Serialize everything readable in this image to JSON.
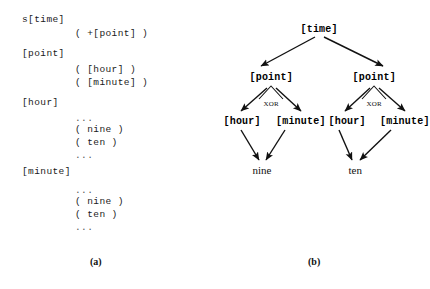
{
  "figure": {
    "panel_a": {
      "caption": "(a)",
      "lines": [
        {
          "kind": "head",
          "text": "s[time]",
          "x": 22,
          "y": 14
        },
        {
          "kind": "rule",
          "text": "( +[point] )",
          "x": 75,
          "y": 28
        },
        {
          "kind": "head",
          "text": "[point]",
          "x": 22,
          "y": 48
        },
        {
          "kind": "rule",
          "text": "( [hour] )",
          "x": 75,
          "y": 64
        },
        {
          "kind": "rule",
          "text": "( [minute] )",
          "x": 75,
          "y": 77
        },
        {
          "kind": "head",
          "text": "[hour]",
          "x": 22,
          "y": 97
        },
        {
          "kind": "ellip",
          "text": "...",
          "x": 75,
          "y": 113
        },
        {
          "kind": "rule",
          "text": "( nine )",
          "x": 75,
          "y": 124
        },
        {
          "kind": "rule",
          "text": "( ten )",
          "x": 75,
          "y": 137
        },
        {
          "kind": "ellip",
          "text": "...",
          "x": 75,
          "y": 150
        },
        {
          "kind": "head",
          "text": "[minute]",
          "x": 22,
          "y": 166
        },
        {
          "kind": "ellip",
          "text": "...",
          "x": 75,
          "y": 185
        },
        {
          "kind": "rule",
          "text": "( nine )",
          "x": 75,
          "y": 196
        },
        {
          "kind": "rule",
          "text": "( ten )",
          "x": 75,
          "y": 209
        },
        {
          "kind": "ellip",
          "text": "...",
          "x": 75,
          "y": 222
        }
      ]
    },
    "panel_b": {
      "caption": "(b)",
      "nodes": [
        {
          "id": "root",
          "text": "[time]",
          "cx": 104,
          "cy": 29
        },
        {
          "id": "point-l",
          "text": "[point]",
          "cx": 56,
          "cy": 77
        },
        {
          "id": "point-r",
          "text": "[point]",
          "cx": 159,
          "cy": 77
        },
        {
          "id": "hour-l",
          "text": "[hour]",
          "cx": 27,
          "cy": 121
        },
        {
          "id": "min-l",
          "text": "[minute]",
          "cx": 86,
          "cy": 121
        },
        {
          "id": "hour-r",
          "text": "[hour]",
          "cx": 132,
          "cy": 121
        },
        {
          "id": "min-r",
          "text": "[minute]",
          "cx": 190,
          "cy": 121
        }
      ],
      "leaves": [
        {
          "id": "leaf-nine",
          "text": "nine",
          "cx": 47,
          "cy": 170
        },
        {
          "id": "leaf-ten",
          "text": "ten",
          "cx": 140,
          "cy": 170
        }
      ],
      "xor_labels": [
        {
          "id": "xor-left",
          "text": "XOR",
          "cx": 56,
          "cy": 104
        },
        {
          "id": "xor-right",
          "text": "XOR",
          "cx": 159,
          "cy": 104
        }
      ],
      "edges": [
        {
          "from": "root",
          "to": "point-l",
          "x1": 100,
          "y1": 37,
          "x2": 46,
          "y2": 66
        },
        {
          "from": "root",
          "to": "point-r",
          "x1": 109,
          "y1": 37,
          "x2": 168,
          "y2": 66
        },
        {
          "from": "point-l",
          "to": "hour-l",
          "x1": 52,
          "y1": 88,
          "x2": 26,
          "y2": 111
        },
        {
          "from": "point-l",
          "to": "min-l",
          "x1": 61,
          "y1": 88,
          "x2": 86,
          "y2": 111
        },
        {
          "from": "point-r",
          "to": "hour-r",
          "x1": 155,
          "y1": 88,
          "x2": 130,
          "y2": 111
        },
        {
          "from": "point-r",
          "to": "min-r",
          "x1": 164,
          "y1": 88,
          "x2": 190,
          "y2": 111
        },
        {
          "from": "hour-l",
          "to": "leaf-nine",
          "x1": 26,
          "y1": 130,
          "x2": 44,
          "y2": 160
        },
        {
          "from": "min-l",
          "to": "leaf-nine",
          "x1": 70,
          "y1": 130,
          "x2": 51,
          "y2": 160
        },
        {
          "from": "hour-r",
          "to": "leaf-ten",
          "x1": 124,
          "y1": 130,
          "x2": 137,
          "y2": 160
        },
        {
          "from": "min-r",
          "to": "leaf-ten",
          "x1": 176,
          "y1": 130,
          "x2": 145,
          "y2": 160
        }
      ],
      "xor_arcs": [
        {
          "id": "arc-left",
          "path": "M 44 99 L 56 86 L 68 99"
        },
        {
          "id": "arc-right",
          "path": "M 147 99 L 159 86 L 171 99"
        }
      ]
    },
    "caption_positions": {
      "a_x": 90,
      "a_y": 256,
      "b_x": 308,
      "b_y": 256
    },
    "colors": {
      "ink": "#111111",
      "background": "#ffffff",
      "ellipsis": "#555555"
    }
  }
}
